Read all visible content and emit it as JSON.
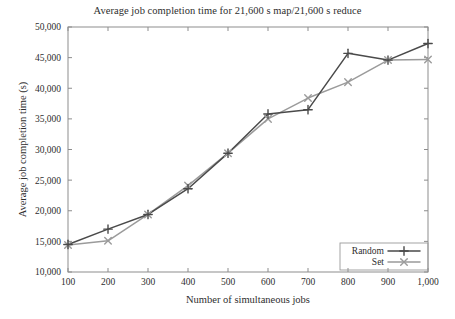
{
  "chart_data": {
    "type": "line",
    "title": "Average job completion time for 21,600 s map/21,600 s reduce",
    "xlabel": "Number of simultaneous jobs",
    "ylabel": "Average job completion time (s)",
    "x": [
      100,
      200,
      300,
      400,
      500,
      600,
      700,
      800,
      900,
      1000
    ],
    "xticklabels": [
      "100",
      "200",
      "300",
      "400",
      "500",
      "600",
      "700",
      "800",
      "900",
      "1,000"
    ],
    "yticks": [
      10000,
      15000,
      20000,
      25000,
      30000,
      35000,
      40000,
      45000,
      50000
    ],
    "yticklabels": [
      "10,000",
      "15,000",
      "20,000",
      "25,000",
      "30,000",
      "35,000",
      "40,000",
      "45,000",
      "50,000"
    ],
    "xlim": [
      100,
      1000
    ],
    "ylim": [
      10000,
      50000
    ],
    "grid": false,
    "legend_position": "lower right",
    "series": [
      {
        "name": "Random",
        "marker": "plus",
        "color": "#4a4a4a",
        "values": [
          14500,
          17000,
          19400,
          23600,
          29400,
          35800,
          36500,
          45700,
          44600,
          47300
        ]
      },
      {
        "name": "Set",
        "marker": "cross",
        "color": "#9b9b9b",
        "values": [
          14400,
          15100,
          19400,
          24100,
          29400,
          35000,
          38400,
          41000,
          44600,
          44700
        ]
      }
    ]
  },
  "legend": {
    "entries": [
      {
        "label": "Random"
      },
      {
        "label": "Set"
      }
    ]
  },
  "colors": {
    "series_random": "#4a4a4a",
    "series_set": "#9b9b9b",
    "axis": "#8d8d8d",
    "text": "#2e2e2e",
    "background": "#ffffff"
  }
}
